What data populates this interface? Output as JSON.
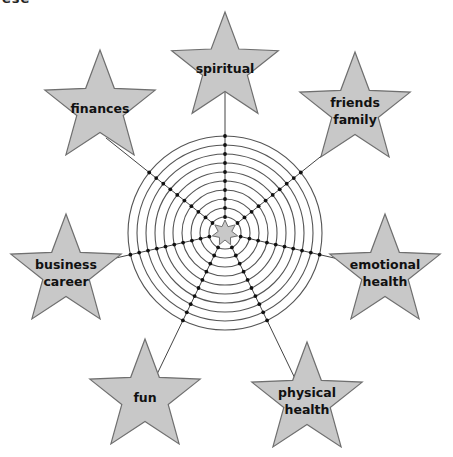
{
  "diagram": {
    "type": "wheel-of-life",
    "cropped_top_text": "ese",
    "center": {
      "x": 225,
      "y": 233
    },
    "rings": {
      "count": 10,
      "outer_radius": 97,
      "inner_radius": 16
    },
    "center_star": {
      "points": 7,
      "radius": 13,
      "inner_radius": 7
    },
    "colors": {
      "star_fill": "#c8c8c8",
      "star_stroke": "#6f6f6f",
      "ring_stroke": "#555555",
      "spoke_stroke": "#444444",
      "dot": "#111111",
      "text": "#111111"
    },
    "categories": [
      {
        "id": "spiritual",
        "lines": [
          "spiritual"
        ],
        "angle": -90,
        "star": {
          "cx": 225,
          "cy": 68,
          "r": 56
        }
      },
      {
        "id": "friends-family",
        "lines": [
          "friends",
          "family"
        ],
        "angle": -38.6,
        "star": {
          "cx": 355,
          "cy": 110,
          "r": 58
        }
      },
      {
        "id": "emotional-health",
        "lines": [
          "emotional",
          "health"
        ],
        "angle": 12.9,
        "star": {
          "cx": 385,
          "cy": 272,
          "r": 58
        }
      },
      {
        "id": "physical-health",
        "lines": [
          "physical",
          "health"
        ],
        "angle": 64.3,
        "star": {
          "cx": 307,
          "cy": 400,
          "r": 58
        }
      },
      {
        "id": "fun",
        "lines": [
          "fun"
        ],
        "angle": 115.7,
        "star": {
          "cx": 145,
          "cy": 397,
          "r": 58
        }
      },
      {
        "id": "business-career",
        "lines": [
          "business",
          "career"
        ],
        "angle": 167.1,
        "star": {
          "cx": 66,
          "cy": 272,
          "r": 58
        }
      },
      {
        "id": "finances",
        "lines": [
          "finances"
        ],
        "angle": 218.6,
        "star": {
          "cx": 100,
          "cy": 108,
          "r": 58
        }
      }
    ]
  }
}
